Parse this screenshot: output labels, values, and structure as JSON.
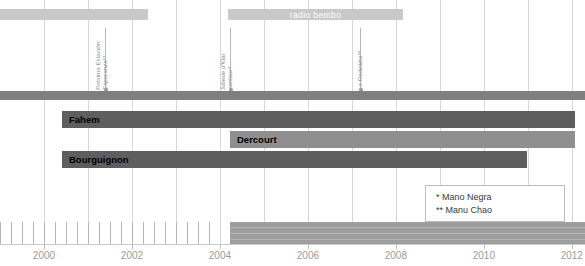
{
  "chart_data": {
    "type": "bar",
    "title": "",
    "xlabel": "",
    "ylabel": "",
    "xlim": [
      1999.0,
      2012.3
    ],
    "grid": true,
    "legend_position": "bottom-right",
    "axis": {
      "tick_labels": [
        "2000",
        "2002",
        "2004",
        "2006",
        "2008",
        "2010",
        "2012"
      ],
      "tick_values": [
        2000,
        2002,
        2004,
        2006,
        2008,
        2010,
        2012
      ],
      "minor_tick_step": 0.25
    },
    "categories": [
      "Fahem",
      "Dercourt",
      "Bourguignon"
    ],
    "series": [
      {
        "name": "Fahem",
        "start": 2000.4,
        "end": 2012.3
      },
      {
        "name": "Dercourt",
        "start": 2004.0,
        "end": 2012.3
      },
      {
        "name": "Bourguignon",
        "start": 2000.4,
        "end": 2011.0
      }
    ],
    "bands": [
      {
        "name": "era-band",
        "label": "",
        "start": 1999.0,
        "end": 2012.3
      },
      {
        "name": "banner-left",
        "label": "",
        "start": 1999.0,
        "end": 2002.4
      },
      {
        "name": "banner-radio-bembo",
        "label": "radio bembo",
        "start": 2003.95,
        "end": 2008.55
      }
    ],
    "annotations": [
      {
        "label_lines": [
          "Próxima Estación:",
          "Esperanza**"
        ],
        "x": 2000.9
      },
      {
        "label_lines": [
          "Siberie d'Klar",
          "cantaor*"
        ],
        "x": 2004.0
      },
      {
        "label_lines": [
          "La Radiolina**"
        ],
        "x": 2006.95
      }
    ],
    "bottom_axis_band": {
      "hatched_start": 1999.0,
      "hatched_end": 2004.0,
      "solid_start": 2004.0,
      "solid_end": 2012.3
    }
  },
  "banners": [
    {
      "id": "banner-left",
      "label": ""
    },
    {
      "id": "banner-radio-bembo",
      "label": "radio bembo"
    }
  ],
  "annotations": [
    {
      "line1": "Próxima Estación:",
      "line2": "Esperanza**"
    },
    {
      "line1": "Siberie d'Klar",
      "line2": "cantaor*"
    },
    {
      "line1": "La Radiolina**",
      "line2": ""
    }
  ],
  "members": [
    {
      "name": "Fahem"
    },
    {
      "name": "Dercourt"
    },
    {
      "name": "Bourguignon"
    }
  ],
  "legend": {
    "rows": [
      {
        "text": "*  Mano Negra"
      },
      {
        "text": "** Manu Chao"
      }
    ]
  },
  "axis": {
    "labels": [
      "2000",
      "2002",
      "2004",
      "2006",
      "2008",
      "2010",
      "2012"
    ]
  },
  "colors": {
    "bar_dark": "#5e5e5e",
    "bar_mid": "#8f8f8f",
    "band": "#7f7f7f",
    "banner": "#c9c9c9",
    "grid": "#d6d6d6",
    "axis_text": "#9a9a9a"
  }
}
